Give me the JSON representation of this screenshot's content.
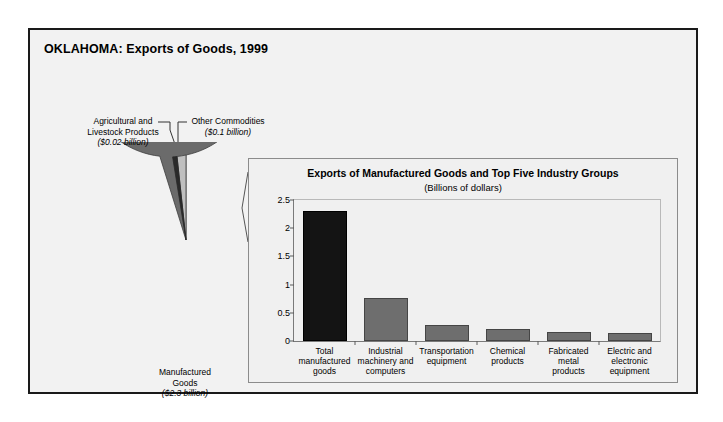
{
  "chart_title": "OKLAHOMA: Exports of Goods, 1999",
  "pie": {
    "labels": [
      {
        "name": "Agricultural and Livestock Products",
        "line1": "Agricultural and",
        "line2": "Livestock Products",
        "value_text": "($0.02 billion)"
      },
      {
        "name": "Other Commodities",
        "line1": "Other Commodities",
        "line2": "",
        "value_text": "($0.1 billion)"
      },
      {
        "name": "Manufactured Goods",
        "line1": "Manufactured",
        "line2": "Goods",
        "value_text": "($2.3 billion)"
      }
    ]
  },
  "panel": {
    "title": "Exports of Manufactured Goods and Top Five Industry Groups",
    "subtitle": "(Billions of dollars)"
  },
  "chart_data": [
    {
      "type": "pie",
      "title": "OKLAHOMA: Exports of Goods, 1999",
      "unit": "Billions of dollars",
      "labels": [
        "Manufactured Goods",
        "Agricultural and Livestock Products",
        "Other Commodities"
      ],
      "values": [
        2.3,
        0.02,
        0.1
      ],
      "value_labels": [
        "($2.3 billion)",
        "($0.02 billion)",
        "($0.1 billion)"
      ],
      "colors": [
        "#6b6b6b",
        "#2a2a2a",
        "#bfbfbf"
      ],
      "start_angle_deg": 90,
      "direction": "counterclockwise",
      "legend": "labels-with-leader-lines"
    },
    {
      "type": "bar",
      "title": "Exports of Manufactured Goods and Top Five Industry Groups",
      "subtitle": "(Billions of dollars)",
      "xlabel": "",
      "ylabel": "",
      "ylim": [
        0,
        2.5
      ],
      "yticks": [
        0,
        0.5,
        1,
        1.5,
        2,
        2.5
      ],
      "ytick_labels": [
        "0",
        "0.5",
        "1",
        "1.5",
        "2",
        "2.5"
      ],
      "grid": false,
      "categories": [
        "Total manufactured goods",
        "Industrial machinery and computers",
        "Transportation equipment",
        "Chemical products",
        "Fabricated metal products",
        "Electric and electronic equipment"
      ],
      "category_lines": [
        [
          "Total",
          "manufactured",
          "goods"
        ],
        [
          "Industrial",
          "machinery and",
          "computers"
        ],
        [
          "Transportation",
          "equipment"
        ],
        [
          "Chemical",
          "products"
        ],
        [
          "Fabricated",
          "metal",
          "products"
        ],
        [
          "Electric and",
          "electronic",
          "equipment"
        ]
      ],
      "values": [
        2.3,
        0.77,
        0.28,
        0.22,
        0.16,
        0.14
      ],
      "bar_colors": [
        "#141414",
        "#6e6e6e",
        "#6e6e6e",
        "#6e6e6e",
        "#6e6e6e",
        "#6e6e6e"
      ]
    }
  ]
}
